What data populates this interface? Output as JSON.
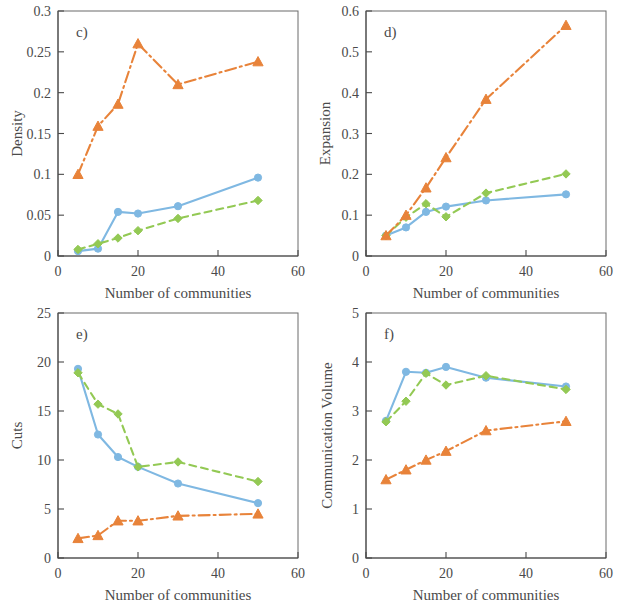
{
  "figure": {
    "panels": [
      {
        "letter": "c)",
        "ylabel": "Density",
        "xlabel": "Number of communities"
      },
      {
        "letter": "d)",
        "ylabel": "Expansion",
        "xlabel": "Number of communities"
      },
      {
        "letter": "e)",
        "ylabel": "Cuts",
        "xlabel": "Number of communities"
      },
      {
        "letter": "f)",
        "ylabel": "Communication  Volume",
        "xlabel": "Number of communities"
      }
    ]
  },
  "colors": {
    "blue": "#7FB8E2",
    "green": "#93C954",
    "orange": "#E8833A",
    "axis": "#4a4a4a",
    "frame": "#6a6a6a",
    "background": "#ffffff"
  },
  "chart_data": [
    {
      "type": "line",
      "title": "c)",
      "xlabel": "Number of communities",
      "ylabel": "Density",
      "xlim": [
        0,
        60
      ],
      "ylim": [
        0,
        0.3
      ],
      "xticks": [
        0,
        20,
        40,
        60
      ],
      "xtick_labels": [
        "0",
        "20",
        "40",
        "60"
      ],
      "yticks": [
        0,
        0.05,
        0.1,
        0.15,
        0.2,
        0.25,
        0.3
      ],
      "ytick_labels": [
        "0",
        "0.05",
        "0.1",
        "0.15",
        "0.2",
        "0.25",
        "0.3"
      ],
      "grid": false,
      "legend": "none",
      "x": [
        5,
        10,
        15,
        20,
        30,
        50
      ],
      "series": [
        {
          "name": "blue",
          "color": "#7FB8E2",
          "marker": "circle",
          "linestyle": "solid",
          "values": [
            0.006,
            0.009,
            0.054,
            0.052,
            0.061,
            0.096
          ]
        },
        {
          "name": "green",
          "color": "#93C954",
          "marker": "diamond",
          "linestyle": "dashed",
          "values": [
            0.008,
            0.015,
            0.022,
            0.031,
            0.046,
            0.068
          ]
        },
        {
          "name": "orange",
          "color": "#E8833A",
          "marker": "triangle",
          "linestyle": "dashdot",
          "values": [
            0.1,
            0.159,
            0.186,
            0.26,
            0.21,
            0.238
          ]
        }
      ]
    },
    {
      "type": "line",
      "title": "d)",
      "xlabel": "Number of communities",
      "ylabel": "Expansion",
      "xlim": [
        0,
        60
      ],
      "ylim": [
        0,
        0.6
      ],
      "xticks": [
        0,
        20,
        40,
        60
      ],
      "xtick_labels": [
        "0",
        "20",
        "40",
        "60"
      ],
      "yticks": [
        0,
        0.1,
        0.2,
        0.3,
        0.4,
        0.5,
        0.6
      ],
      "ytick_labels": [
        "0",
        "0.1",
        "0.2",
        "0.3",
        "0.4",
        "0.5",
        "0.6"
      ],
      "grid": false,
      "legend": "none",
      "x": [
        5,
        10,
        15,
        20,
        30,
        50
      ],
      "series": [
        {
          "name": "blue",
          "color": "#7FB8E2",
          "marker": "circle",
          "linestyle": "solid",
          "values": [
            0.05,
            0.07,
            0.108,
            0.121,
            0.136,
            0.151
          ]
        },
        {
          "name": "green",
          "color": "#93C954",
          "marker": "diamond",
          "linestyle": "dashed",
          "values": [
            0.05,
            0.095,
            0.128,
            0.096,
            0.154,
            0.201
          ]
        },
        {
          "name": "orange",
          "color": "#E8833A",
          "marker": "triangle",
          "linestyle": "dashdot",
          "values": [
            0.05,
            0.1,
            0.167,
            0.241,
            0.384,
            0.565
          ]
        }
      ]
    },
    {
      "type": "line",
      "title": "e)",
      "xlabel": "Number of communities",
      "ylabel": "Cuts",
      "xlim": [
        0,
        60
      ],
      "ylim": [
        0,
        25
      ],
      "xticks": [
        0,
        20,
        40,
        60
      ],
      "xtick_labels": [
        "0",
        "20",
        "40",
        "60"
      ],
      "yticks": [
        0,
        5,
        10,
        15,
        20,
        25
      ],
      "ytick_labels": [
        "0",
        "5",
        "10",
        "15",
        "20",
        "25"
      ],
      "grid": false,
      "legend": "none",
      "x": [
        5,
        10,
        15,
        20,
        30,
        50
      ],
      "series": [
        {
          "name": "blue",
          "color": "#7FB8E2",
          "marker": "circle",
          "linestyle": "solid",
          "values": [
            19.3,
            12.6,
            10.3,
            9.3,
            7.6,
            5.6
          ]
        },
        {
          "name": "green",
          "color": "#93C954",
          "marker": "diamond",
          "linestyle": "dashed",
          "values": [
            18.9,
            15.7,
            14.7,
            9.3,
            9.8,
            7.8
          ]
        },
        {
          "name": "orange",
          "color": "#E8833A",
          "marker": "triangle",
          "linestyle": "dashdot",
          "values": [
            2.0,
            2.3,
            3.8,
            3.8,
            4.3,
            4.5
          ]
        }
      ]
    },
    {
      "type": "line",
      "title": "f)",
      "xlabel": "Number of communities",
      "ylabel": "Communication  Volume",
      "xlim": [
        0,
        60
      ],
      "ylim": [
        0,
        5
      ],
      "xticks": [
        0,
        20,
        40,
        60
      ],
      "xtick_labels": [
        "0",
        "20",
        "40",
        "60"
      ],
      "yticks": [
        0,
        1,
        2,
        3,
        4,
        5
      ],
      "ytick_labels": [
        "0",
        "1",
        "2",
        "3",
        "4",
        "5"
      ],
      "grid": false,
      "legend": "none",
      "x": [
        5,
        10,
        15,
        20,
        30,
        50
      ],
      "series": [
        {
          "name": "blue",
          "color": "#7FB8E2",
          "marker": "circle",
          "linestyle": "solid",
          "values": [
            2.8,
            3.8,
            3.78,
            3.9,
            3.68,
            3.5
          ]
        },
        {
          "name": "green",
          "color": "#93C954",
          "marker": "diamond",
          "linestyle": "dashed",
          "values": [
            2.78,
            3.2,
            3.77,
            3.53,
            3.72,
            3.44
          ]
        },
        {
          "name": "orange",
          "color": "#E8833A",
          "marker": "triangle",
          "linestyle": "dashdot",
          "values": [
            1.6,
            1.8,
            2.0,
            2.18,
            2.6,
            2.79
          ]
        }
      ]
    }
  ]
}
